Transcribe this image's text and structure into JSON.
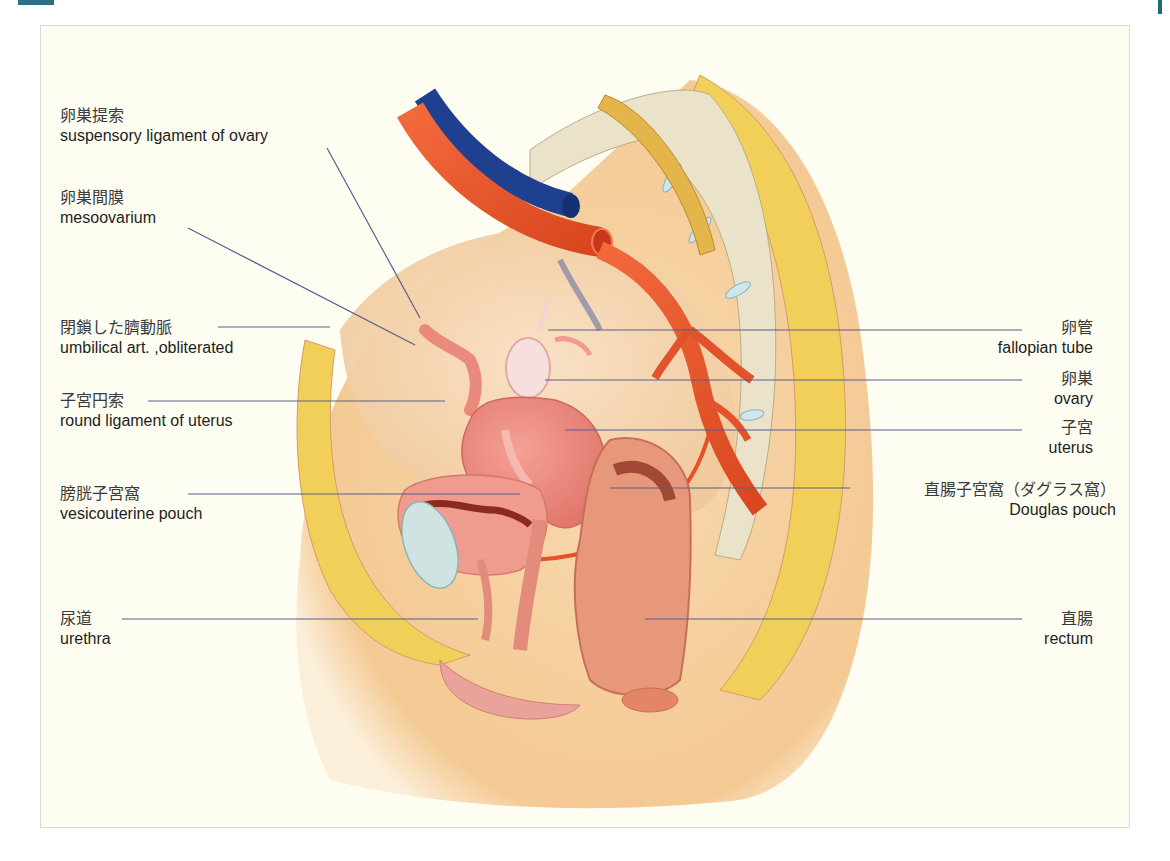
{
  "figure": {
    "type": "anatomical illustration",
    "colors": {
      "panel_background": "#fefdf2",
      "leader_line": "#5b5f8c",
      "artery": "#e2522b",
      "vein": "#1f3f8f",
      "fat": "#f2cf59",
      "bone": "#e9e2c8",
      "skin": "#f6d6ae",
      "accent_tab": "#2b6e86"
    }
  },
  "labels_left": [
    {
      "id": "suspensory-ligament",
      "ja": "卵巣提索",
      "en": "suspensory ligament of ovary"
    },
    {
      "id": "mesoovarium",
      "ja": "卵巣間膜",
      "en": "mesoovarium"
    },
    {
      "id": "umbilical-artery",
      "ja": "閉鎖した臍動脈",
      "en": "umbilical art. ,obliterated"
    },
    {
      "id": "round-ligament",
      "ja": "子宮円索",
      "en": "round ligament of uterus"
    },
    {
      "id": "vesicouterine-pouch",
      "ja": "膀胱子宮窩",
      "en": "vesicouterine pouch"
    },
    {
      "id": "urethra",
      "ja": "尿道",
      "en": "urethra"
    }
  ],
  "labels_right": [
    {
      "id": "fallopian-tube",
      "ja": "卵管",
      "en": "fallopian tube"
    },
    {
      "id": "ovary",
      "ja": "卵巣",
      "en": "ovary"
    },
    {
      "id": "uterus",
      "ja": "子宮",
      "en": "uterus"
    },
    {
      "id": "douglas-pouch",
      "ja": "直腸子宮窩（ダグラス窩）",
      "en": "Douglas pouch"
    },
    {
      "id": "rectum",
      "ja": "直腸",
      "en": "rectum"
    }
  ]
}
